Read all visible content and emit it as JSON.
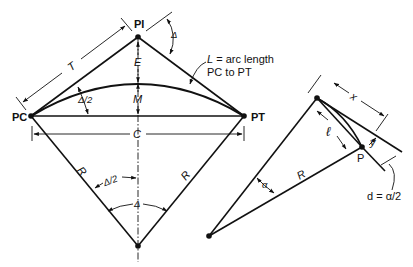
{
  "figure": {
    "main_diagram": {
      "points": {
        "pi": "PI",
        "pc": "PC",
        "pt": "PT"
      },
      "labels": {
        "tangent": "T",
        "external": "E",
        "middle_ordinate": "M",
        "chord": "C",
        "radius_left": "R",
        "radius_right": "R",
        "half_delta_chord": "Δ/2",
        "half_delta_center": "Δ/2",
        "delta_center": "Δ",
        "delta_pi": "Δ",
        "arc_length_line1": "L = arc length",
        "arc_length_var": "L",
        "arc_length_rest": " = arc length",
        "arc_length_line2": "PC to PT"
      }
    },
    "detail_diagram": {
      "labels": {
        "point": "P",
        "tangent_offset_x": "x",
        "offset_y": "y",
        "chord_l": "ℓ",
        "radius": "R",
        "angle_alpha": "α",
        "deflection": "d = α/2"
      }
    }
  }
}
